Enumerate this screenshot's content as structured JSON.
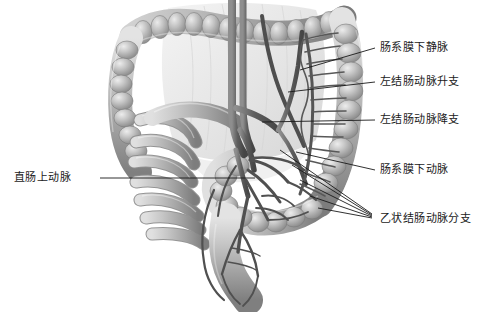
{
  "figure": {
    "background": "#ffffff",
    "ink": "#1a1a1a",
    "organ_fill_light": "#d2d2d2",
    "organ_fill_mid": "#b0b0b0",
    "organ_fill_dark": "#8a8a8a",
    "vessel_color": "#5a5a5a",
    "mesentery_color": "#e2e2e2"
  },
  "labels": [
    {
      "id": "imv",
      "text": "肠系膜下静脉",
      "x": 380,
      "y": 42,
      "side": "right"
    },
    {
      "id": "lca-ascend",
      "text": "左结肠动脉升支",
      "x": 380,
      "y": 76,
      "side": "right"
    },
    {
      "id": "lca-descend",
      "text": "左结肠动脉降支",
      "x": 380,
      "y": 114,
      "side": "right"
    },
    {
      "id": "ima",
      "text": "肠系膜下动脉",
      "x": 380,
      "y": 164,
      "side": "right"
    },
    {
      "id": "sigmoid",
      "text": "乙状结肠动脉分支",
      "x": 380,
      "y": 213,
      "side": "right"
    },
    {
      "id": "sra",
      "text": "直肠上动脉",
      "x": 14,
      "y": 172,
      "side": "left"
    }
  ],
  "leader_lines": [
    {
      "id": "imv",
      "from": [
        375,
        48
      ],
      "to": [
        300,
        70
      ]
    },
    {
      "id": "lca-ascend",
      "from": [
        375,
        82
      ],
      "to": [
        288,
        92
      ]
    },
    {
      "id": "lca-descend",
      "from": [
        375,
        120
      ],
      "to": [
        262,
        122
      ]
    },
    {
      "id": "ima",
      "from": [
        375,
        170
      ],
      "to": [
        296,
        152
      ]
    },
    {
      "id": "sra",
      "from": [
        100,
        178
      ],
      "to": [
        255,
        178
      ]
    },
    {
      "id": "sigmoid-a",
      "from": [
        372,
        214
      ],
      "to": [
        280,
        150
      ]
    },
    {
      "id": "sigmoid-b",
      "from": [
        372,
        215
      ],
      "to": [
        292,
        165
      ]
    },
    {
      "id": "sigmoid-c",
      "from": [
        372,
        216
      ],
      "to": [
        300,
        180
      ]
    },
    {
      "id": "sigmoid-d",
      "from": [
        372,
        217
      ],
      "to": [
        310,
        196
      ]
    },
    {
      "id": "sigmoid-e",
      "from": [
        372,
        218
      ],
      "to": [
        318,
        208
      ]
    }
  ],
  "structures": [
    {
      "id": "transverse-colon",
      "name": "横结肠"
    },
    {
      "id": "ascending-colon",
      "name": "升结肠"
    },
    {
      "id": "descending-colon",
      "name": "降结肠"
    },
    {
      "id": "sigmoid-colon",
      "name": "乙状结肠"
    },
    {
      "id": "rectum",
      "name": "直肠"
    },
    {
      "id": "small-intestine",
      "name": "小肠袢"
    },
    {
      "id": "mesentery",
      "name": "肠系膜"
    },
    {
      "id": "vascular-arcade",
      "name": "边缘动脉弓"
    }
  ]
}
